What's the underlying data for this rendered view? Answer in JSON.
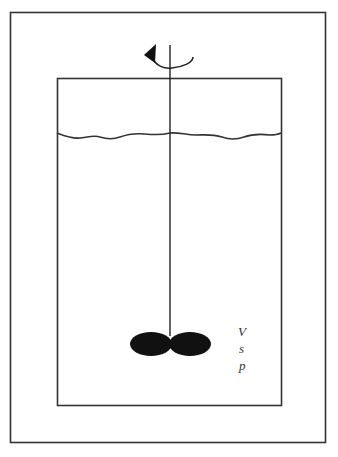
{
  "diagram": {
    "title": "",
    "labels": {
      "v": "V",
      "s": "s",
      "p": "p"
    },
    "icons": {
      "rotation": "rotation-arrow-icon"
    },
    "colors": {
      "stroke": "#333333",
      "impeller": "#111111",
      "background": "#ffffff"
    }
  }
}
